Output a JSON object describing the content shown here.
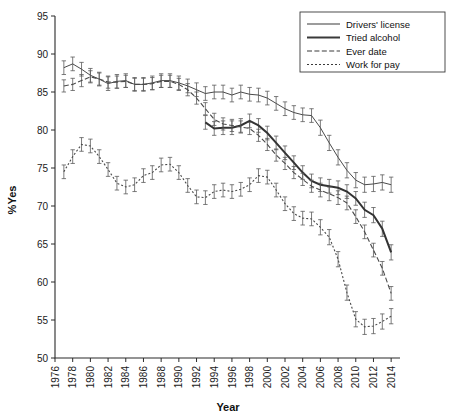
{
  "figure": {
    "background": "#ffffff",
    "line_color": "#4a4a4a",
    "accent": "#333333"
  },
  "chart_data": {
    "type": "line",
    "title": "",
    "xlabel": "Year",
    "ylabel": "%Yes",
    "xlim": [
      1976,
      2015
    ],
    "ylim": [
      50,
      95
    ],
    "ytick_step": 5,
    "xtick_step": 2,
    "grid": false,
    "legend_position": "top-right",
    "yticks": [
      50,
      55,
      60,
      65,
      70,
      75,
      80,
      85,
      90,
      95
    ],
    "xticks": [
      1976,
      1978,
      1980,
      1982,
      1984,
      1986,
      1988,
      1990,
      1992,
      1994,
      1996,
      1998,
      2000,
      2002,
      2004,
      2006,
      2008,
      2010,
      2012,
      2014
    ],
    "error_bars": true,
    "series": [
      {
        "name": "Drivers' license",
        "style": "solid-thin",
        "x": [
          1977,
          1978,
          1979,
          1980,
          1981,
          1982,
          1983,
          1984,
          1985,
          1986,
          1987,
          1988,
          1989,
          1990,
          1991,
          1992,
          1993,
          1994,
          1995,
          1996,
          1997,
          1998,
          1999,
          2000,
          2001,
          2002,
          2003,
          2004,
          2005,
          2006,
          2007,
          2008,
          2009,
          2010,
          2011,
          2012,
          2013,
          2014
        ],
        "values": [
          88.2,
          88.7,
          88.0,
          87.2,
          86.7,
          86.1,
          86.4,
          86.5,
          86.0,
          86.0,
          86.2,
          86.5,
          86.5,
          86.2,
          85.8,
          85.3,
          84.8,
          85.0,
          85.0,
          84.6,
          85.0,
          84.7,
          84.6,
          84.2,
          83.5,
          82.8,
          82.3,
          82.0,
          81.9,
          80.3,
          78.3,
          76.4,
          74.7,
          73.4,
          72.8,
          72.9,
          73.1,
          72.8
        ],
        "errors": [
          0.9,
          0.9,
          0.9,
          0.9,
          0.9,
          0.9,
          0.9,
          0.9,
          0.9,
          0.9,
          0.9,
          0.9,
          0.9,
          0.9,
          0.9,
          0.9,
          0.9,
          0.9,
          0.9,
          0.9,
          0.9,
          0.9,
          0.9,
          0.9,
          0.9,
          0.9,
          0.9,
          0.9,
          0.9,
          1.0,
          1.0,
          1.0,
          1.0,
          1.0,
          1.0,
          1.0,
          1.0,
          1.0
        ]
      },
      {
        "name": "Tried alcohol",
        "style": "solid-thick",
        "x": [
          1993,
          1994,
          1995,
          1996,
          1997,
          1998,
          1999,
          2000,
          2001,
          2002,
          2003,
          2004,
          2005,
          2006,
          2007,
          2008,
          2009,
          2010,
          2011,
          2012,
          2013,
          2014
        ],
        "values": [
          81.0,
          80.2,
          80.3,
          80.3,
          80.6,
          81.2,
          80.6,
          79.6,
          78.3,
          77.0,
          75.7,
          74.4,
          73.3,
          72.8,
          72.6,
          72.4,
          71.9,
          71.0,
          69.5,
          68.8,
          67.0,
          63.9
        ],
        "errors": [
          0.9,
          0.9,
          0.9,
          0.9,
          0.9,
          0.9,
          0.9,
          0.9,
          0.9,
          0.9,
          0.9,
          0.9,
          0.9,
          0.9,
          0.9,
          0.9,
          0.9,
          0.9,
          1.0,
          1.0,
          1.0,
          1.0
        ]
      },
      {
        "name": "Ever date",
        "style": "dashed",
        "x": [
          1977,
          1978,
          1979,
          1980,
          1981,
          1982,
          1983,
          1984,
          1985,
          1986,
          1987,
          1988,
          1989,
          1990,
          1991,
          1992,
          1993,
          1994,
          1995,
          1996,
          1997,
          1998,
          1999,
          2000,
          2001,
          2002,
          2003,
          2004,
          2005,
          2006,
          2007,
          2008,
          2009,
          2010,
          2011,
          2012,
          2013,
          2014
        ],
        "values": [
          85.8,
          86.0,
          86.5,
          87.0,
          86.7,
          86.3,
          86.3,
          86.4,
          86.0,
          86.0,
          86.1,
          86.4,
          86.4,
          86.0,
          85.3,
          84.2,
          82.8,
          81.4,
          80.8,
          80.6,
          80.4,
          80.2,
          79.3,
          78.1,
          76.7,
          75.6,
          74.4,
          73.5,
          72.6,
          72.1,
          71.6,
          71.1,
          70.4,
          68.6,
          66.6,
          64.2,
          61.8,
          58.5
        ],
        "errors": [
          0.8,
          0.8,
          0.8,
          0.8,
          0.8,
          0.8,
          0.8,
          0.8,
          0.8,
          0.8,
          0.8,
          0.8,
          0.8,
          0.8,
          0.8,
          0.8,
          0.8,
          0.8,
          0.8,
          0.8,
          0.8,
          0.8,
          0.8,
          0.8,
          0.8,
          0.8,
          0.8,
          0.8,
          0.8,
          0.9,
          0.9,
          0.9,
          0.9,
          0.9,
          0.9,
          0.9,
          0.9,
          0.9
        ]
      },
      {
        "name": "Work for pay",
        "style": "dotted",
        "x": [
          1977,
          1978,
          1979,
          1980,
          1981,
          1982,
          1983,
          1984,
          1985,
          1986,
          1987,
          1988,
          1989,
          1990,
          1991,
          1992,
          1993,
          1994,
          1995,
          1996,
          1997,
          1998,
          1999,
          2000,
          2001,
          2002,
          2003,
          2004,
          2005,
          2006,
          2007,
          2008,
          2009,
          2010,
          2011,
          2012,
          2013,
          2014
        ],
        "values": [
          74.5,
          76.5,
          78.1,
          77.9,
          76.5,
          74.8,
          73.0,
          72.5,
          72.8,
          74.0,
          74.4,
          75.4,
          75.5,
          74.4,
          72.7,
          71.2,
          71.1,
          71.9,
          72.1,
          71.9,
          72.2,
          72.8,
          74.0,
          73.8,
          72.1,
          70.3,
          69.0,
          68.4,
          68.3,
          67.2,
          65.9,
          63.0,
          58.6,
          55.1,
          54.1,
          54.2,
          54.8,
          55.5
        ],
        "errors": [
          0.9,
          0.9,
          0.9,
          0.9,
          0.9,
          0.9,
          0.9,
          0.9,
          0.9,
          0.9,
          0.9,
          0.9,
          0.9,
          0.9,
          0.9,
          0.9,
          0.9,
          0.9,
          0.9,
          0.9,
          0.9,
          0.9,
          0.9,
          0.9,
          0.9,
          0.9,
          0.9,
          0.9,
          0.9,
          1.0,
          1.0,
          1.0,
          1.0,
          1.0,
          1.0,
          1.0,
          1.0,
          1.0
        ]
      }
    ]
  },
  "legend": {
    "items": [
      {
        "label": "Drivers' license",
        "style": "solid-thin"
      },
      {
        "label": "Tried alcohol",
        "style": "solid-thick"
      },
      {
        "label": "Ever date",
        "style": "dashed"
      },
      {
        "label": "Work for pay",
        "style": "dotted"
      }
    ]
  }
}
